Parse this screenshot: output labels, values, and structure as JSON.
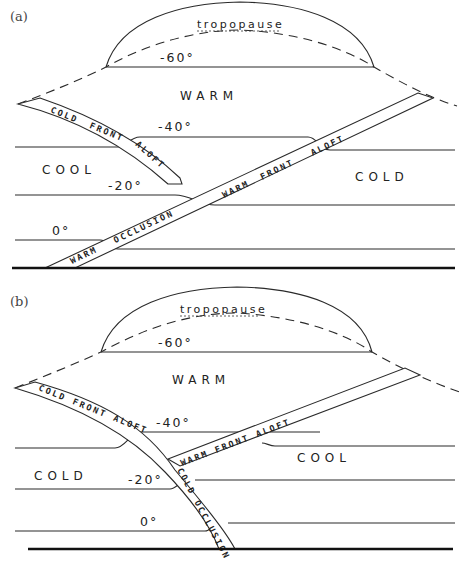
{
  "figure": {
    "panels": [
      {
        "id": "a",
        "label": "(a)",
        "tropopause_label": "tropopause",
        "regions": {
          "upper": "WARM",
          "left": "COOL",
          "right": "COLD"
        },
        "isotherms": [
          "-60°",
          "-40°",
          "-20°",
          "0°"
        ],
        "fronts": {
          "cold_front_aloft": [
            "COLD",
            "FRONT",
            "ALOFT"
          ],
          "warm_front_aloft": [
            "WARM",
            "FRONT",
            "ALOFT"
          ],
          "occlusion": [
            "WARM",
            "OCCLUSION"
          ]
        }
      },
      {
        "id": "b",
        "label": "(b)",
        "tropopause_label": "tropopause",
        "regions": {
          "upper": "WARM",
          "left": "COLD",
          "right": "COOL"
        },
        "isotherms": [
          "-60°",
          "-40°",
          "-20°",
          "0°"
        ],
        "fronts": {
          "cold_front_aloft": "COLD FRONT ALOFT",
          "warm_front_aloft": "WARM FRONT ALOFT",
          "occlusion": "COLD OCCLUSION"
        }
      }
    ]
  }
}
